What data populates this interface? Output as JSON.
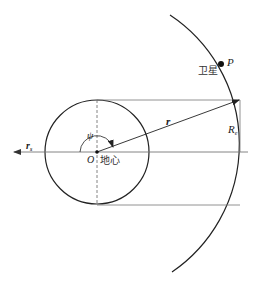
{
  "diagram": {
    "labels": {
      "satellite_cn": "卫星",
      "point": "P",
      "radius_vector": "r",
      "earth_radius_main": "R",
      "earth_radius_sub": "e",
      "psi": "ψ",
      "origin": "O",
      "earth_center_cn": "地心",
      "sun_vector_main": "r",
      "sun_vector_sub": "s"
    },
    "colors": {
      "stroke": "#222222",
      "thin_stroke": "#666666",
      "background": "#ffffff"
    },
    "geometry": {
      "earth_center": [
        97,
        152
      ],
      "earth_radius_px": 52,
      "orbit_radius_px": 155,
      "satellite_position": [
        221,
        64
      ]
    }
  }
}
